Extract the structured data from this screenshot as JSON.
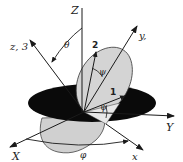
{
  "diagram": {
    "type": "3d-coordinate-rotation",
    "labels": {
      "Z": "Z",
      "z3": "z, 3",
      "theta": "θ",
      "two": "2",
      "y": "y,",
      "psi_upper": "ψ",
      "one": "1",
      "psi_lower": "ψ",
      "Y": "Y",
      "X": "X",
      "x": "x",
      "phi": "φ"
    },
    "colors": {
      "disc": "#0a0a0a",
      "ellipse_fill": "#d4d4d4",
      "lines": "#1a1a1a",
      "background": "#ffffff"
    }
  }
}
